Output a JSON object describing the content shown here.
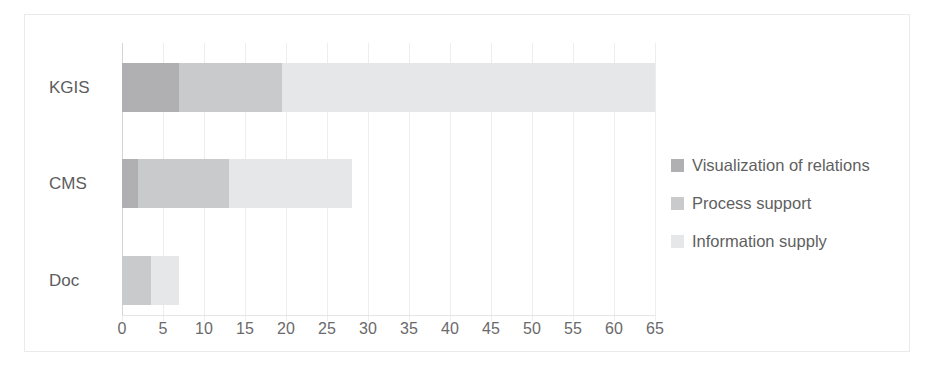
{
  "chart_data": {
    "type": "bar",
    "orientation": "horizontal",
    "stacked": true,
    "title": "",
    "xlabel": "",
    "ylabel": "",
    "categories": [
      "KGIS",
      "CMS",
      "Doc"
    ],
    "series": [
      {
        "name": "Visualization of relations",
        "color": "#b0b0b2",
        "values": [
          7,
          2,
          0
        ]
      },
      {
        "name": "Process support",
        "color": "#c9cacb",
        "values": [
          12.5,
          11,
          3.5
        ]
      },
      {
        "name": "Information supply",
        "color": "#e6e7e8",
        "values": [
          45.5,
          15,
          3.5
        ]
      }
    ],
    "totals": [
      65,
      28,
      7
    ],
    "xlim": [
      0,
      65
    ],
    "xticks": [
      0,
      5,
      10,
      15,
      20,
      25,
      30,
      35,
      40,
      45,
      50,
      55,
      60,
      65
    ],
    "xtick_labels": [
      "0",
      "5",
      "10",
      "15",
      "20",
      "25",
      "30",
      "35",
      "40",
      "45",
      "50",
      "55",
      "60",
      "65"
    ],
    "grid": true,
    "grid_axis": "x",
    "legend_position": "right"
  },
  "legend": {
    "items": [
      {
        "label": "Visualization of relations",
        "swatch": "#b0b0b2"
      },
      {
        "label": "Process support",
        "swatch": "#c9cacb"
      },
      {
        "label": "Information supply",
        "swatch": "#e6e7e8"
      }
    ]
  },
  "colors": {
    "background": "#ffffff",
    "frame": "#e9eaec",
    "gridline": "#eceded",
    "axis": "#d2d4d6",
    "text": "#5c5c5e"
  }
}
